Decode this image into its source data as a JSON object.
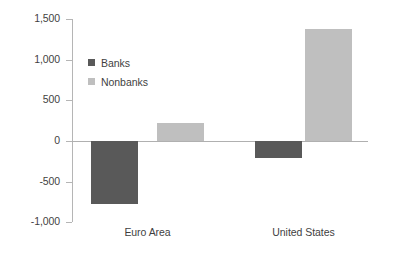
{
  "chart_data": {
    "type": "bar",
    "title": "",
    "subtitle": "",
    "xlabel": "",
    "ylabel": "",
    "categories": [
      "Euro Area",
      "United States"
    ],
    "series": [
      {
        "name": "Banks",
        "color": "#595959",
        "values": [
          -775,
          -210
        ]
      },
      {
        "name": "Nonbanks",
        "color": "#bfbfbf",
        "values": [
          220,
          1380
        ]
      }
    ],
    "ylim": [
      -1000,
      1500
    ],
    "ytick_values": [
      1500,
      1000,
      500,
      0,
      -500,
      -1000
    ],
    "ytick_labels": [
      "1,500",
      "1,000",
      "500",
      "0",
      "-500",
      "-1,000"
    ],
    "grid": false,
    "legend_position": "upper-left-inside",
    "zero_line": true
  },
  "legend": {
    "entries": [
      {
        "label": "Banks",
        "color": "#595959"
      },
      {
        "label": "Nonbanks",
        "color": "#bfbfbf"
      }
    ]
  },
  "axis": {
    "y_labels": [
      "1,500",
      "1,000",
      "500",
      "0",
      "-500",
      "-1,000"
    ],
    "x_labels": [
      "Euro Area",
      "United States"
    ]
  }
}
